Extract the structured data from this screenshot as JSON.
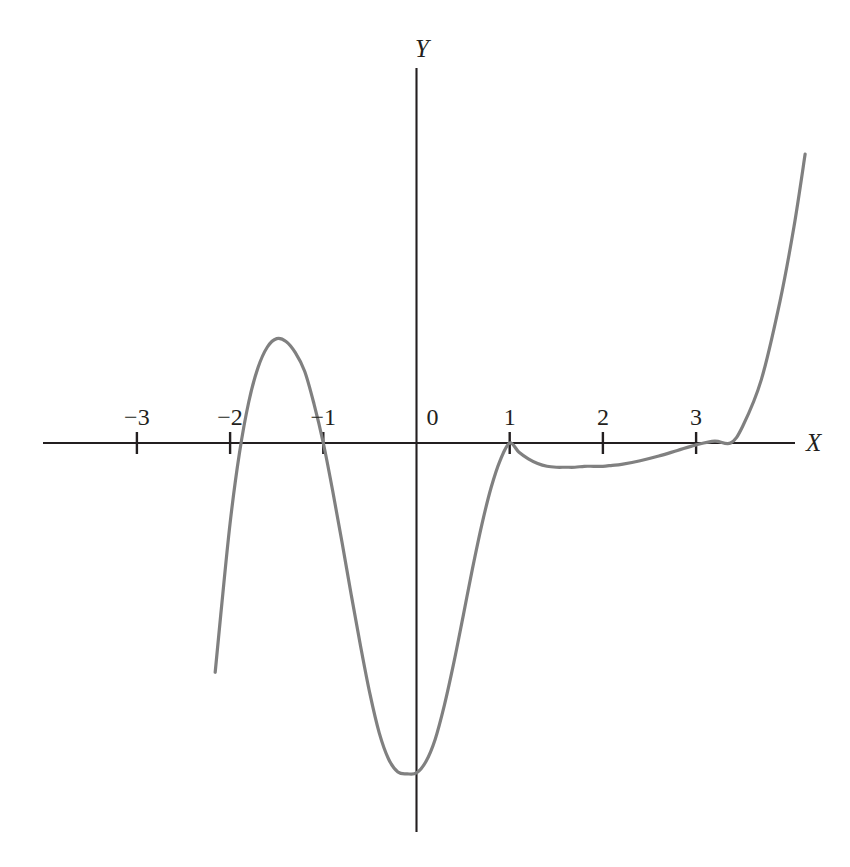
{
  "figure": {
    "width": 850,
    "height": 867,
    "background_color": "#ffffff",
    "axis_color": "#231f20",
    "curve_color": "#808080"
  },
  "axes": {
    "x_label": "X",
    "y_label": "Y",
    "x_tick_labels": [
      "−3",
      "−2",
      "−1",
      "0",
      "1",
      "2",
      "3"
    ],
    "y_tick_labels": []
  },
  "chart_data": {
    "type": "line",
    "title": "",
    "subtitle": "",
    "xlabel": "X",
    "ylabel": "Y",
    "xlim": [
      -4.0,
      4.35
    ],
    "ylim": [
      -3.55,
      3.2
    ],
    "xticks": [
      -3,
      -2,
      -1,
      0,
      1,
      2,
      3
    ],
    "xticklabels": [
      "−3",
      "−2",
      "−1",
      "0",
      "1",
      "2",
      "3"
    ],
    "yticks": [],
    "yticklabels": [],
    "grid": false,
    "legend": false,
    "legend_position": "none",
    "annotations": [],
    "series": [
      {
        "name": "p(x)",
        "color": "#808080",
        "roots": [
          -2.0,
          -1.0,
          1.0,
          3.37
        ],
        "double_roots": [
          1.0
        ],
        "local_maxima": [
          {
            "x": -1.57,
            "y": 3.18
          }
        ],
        "local_minima": [
          {
            "x": 0.02,
            "y": -3.54
          },
          {
            "x": 2.05,
            "y": -0.25
          }
        ],
        "x_start": -2.16,
        "x_end": 4.17,
        "x": [
          -2.16,
          -2.1,
          -2.0,
          -1.9,
          -1.8,
          -1.7,
          -1.6,
          -1.5,
          -1.4,
          -1.3,
          -1.2,
          -1.1,
          -1.0,
          -0.9,
          -0.8,
          -0.7,
          -0.6,
          -0.5,
          -0.4,
          -0.3,
          -0.2,
          -0.1,
          0.0,
          0.1,
          0.2,
          0.3,
          0.4,
          0.5,
          0.6,
          0.7,
          0.8,
          0.9,
          1.0,
          1.1,
          1.2,
          1.3,
          1.4,
          1.5,
          1.6,
          1.7,
          1.8,
          1.9,
          2.0,
          2.1,
          2.2,
          2.4,
          2.6,
          2.8,
          3.0,
          3.2,
          3.37,
          3.5,
          3.7,
          3.9,
          4.05,
          4.17
        ],
        "y": [
          -2.46,
          -1.84,
          -0.86,
          -0.11,
          0.44,
          0.81,
          1.03,
          1.12,
          1.09,
          0.97,
          0.77,
          0.42,
          0.0,
          -0.51,
          -1.06,
          -1.63,
          -2.18,
          -2.69,
          -3.11,
          -3.39,
          -3.53,
          -3.55,
          -3.54,
          -3.42,
          -3.18,
          -2.81,
          -2.36,
          -1.86,
          -1.35,
          -0.88,
          -0.48,
          -0.18,
          0.0,
          -0.1,
          -0.17,
          -0.22,
          -0.25,
          -0.26,
          -0.26,
          -0.26,
          -0.25,
          -0.25,
          -0.25,
          -0.24,
          -0.23,
          -0.19,
          -0.14,
          -0.08,
          -0.02,
          0.02,
          0.0,
          0.18,
          0.68,
          1.52,
          2.32,
          3.1
        ]
      }
    ]
  },
  "geometry": {
    "origin_x": 416.5,
    "origin_y": 443.0,
    "px_per_unit_x": 93.2,
    "px_per_unit_y": 93.2,
    "x_axis_start_px": 43,
    "x_axis_end_px": 795,
    "y_axis_top_px": 68,
    "y_axis_bottom_px": 832,
    "tick_half_length_px": 11
  },
  "labels": {
    "x_axis_label_pos": {
      "x": 806,
      "y": 430
    },
    "y_axis_label_pos": {
      "x": 415,
      "y": 36
    },
    "tick_label_y": 405
  }
}
